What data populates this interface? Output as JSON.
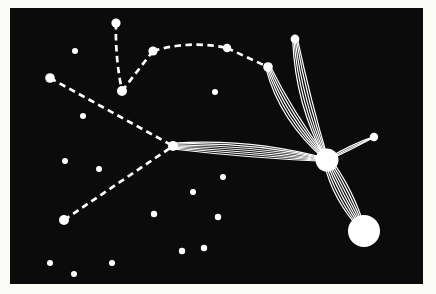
{
  "scene": {
    "description": "Constellation star chart: white stars on a black plate inside a white photo border; dashed lines join constellation stars and bundles of fine rays converge from four stars into a small bright nucleus linked to a large bright nucleus at lower right.",
    "colors": {
      "frame": "#fbfbf8",
      "plate": "#0b0b0b",
      "star": "#ffffff",
      "line": "#ffffff"
    },
    "plate_rect": {
      "x": 10,
      "y": 8,
      "width": 413,
      "height": 276
    },
    "line_style": {
      "dash_width": 2.7,
      "dash_array": "6.5 4.5",
      "strand_width": 1.2
    }
  },
  "stars": [
    {
      "id": "star-top",
      "x": 116,
      "y": 23,
      "r": 4.6
    },
    {
      "id": "star-fork",
      "x": 122,
      "y": 91,
      "r": 5.0
    },
    {
      "id": "star-arc-1",
      "x": 153,
      "y": 51,
      "r": 4.6
    },
    {
      "id": "star-arc-2",
      "x": 227,
      "y": 48,
      "r": 4.2
    },
    {
      "id": "star-arc-3",
      "x": 268,
      "y": 67,
      "r": 4.8
    },
    {
      "id": "star-ray-top",
      "x": 295,
      "y": 39,
      "r": 4.4
    },
    {
      "id": "star-spur",
      "x": 374,
      "y": 137,
      "r": 4.2
    },
    {
      "id": "star-hub",
      "x": 173,
      "y": 146,
      "r": 5.0
    },
    {
      "id": "star-west",
      "x": 50,
      "y": 78,
      "r": 4.8
    },
    {
      "id": "star-southwest",
      "x": 64,
      "y": 220,
      "r": 5.0
    },
    {
      "id": "field-star",
      "x": 75,
      "y": 51,
      "r": 3.0
    },
    {
      "id": "field-star",
      "x": 83,
      "y": 116,
      "r": 3.0
    },
    {
      "id": "field-star",
      "x": 215,
      "y": 92,
      "r": 3.0
    },
    {
      "id": "field-star",
      "x": 65,
      "y": 161,
      "r": 3.0
    },
    {
      "id": "field-star",
      "x": 99,
      "y": 169,
      "r": 3.0
    },
    {
      "id": "field-star",
      "x": 223,
      "y": 177,
      "r": 3.0
    },
    {
      "id": "field-star",
      "x": 193,
      "y": 192,
      "r": 3.0
    },
    {
      "id": "field-star",
      "x": 154,
      "y": 214,
      "r": 3.2
    },
    {
      "id": "field-star",
      "x": 218,
      "y": 217,
      "r": 3.2
    },
    {
      "id": "field-star",
      "x": 182,
      "y": 251,
      "r": 3.2
    },
    {
      "id": "field-star",
      "x": 204,
      "y": 248,
      "r": 3.2
    },
    {
      "id": "field-star",
      "x": 50,
      "y": 263,
      "r": 3.0
    },
    {
      "id": "field-star",
      "x": 74,
      "y": 274,
      "r": 3.0
    },
    {
      "id": "field-star",
      "x": 112,
      "y": 263,
      "r": 3.0
    }
  ],
  "nuclei": [
    {
      "id": "nucleus-inner",
      "x": 327,
      "y": 160,
      "r": 11.5
    },
    {
      "id": "nucleus-outer",
      "x": 364,
      "y": 231,
      "r": 16.0
    }
  ],
  "dashed_links": [
    {
      "from": [
        116,
        23
      ],
      "to": [
        122,
        91
      ],
      "ctrl": [
        115,
        57
      ]
    },
    {
      "from": [
        122,
        91
      ],
      "to": [
        153,
        51
      ]
    },
    {
      "from": [
        153,
        51
      ],
      "to": [
        227,
        48
      ],
      "ctrl": [
        190,
        40
      ]
    },
    {
      "from": [
        227,
        48
      ],
      "to": [
        268,
        67
      ]
    },
    {
      "from": [
        50,
        78
      ],
      "to": [
        173,
        146
      ]
    },
    {
      "from": [
        64,
        220
      ],
      "to": [
        173,
        146
      ]
    }
  ],
  "ray_bundles": [
    {
      "from": [
        173,
        146
      ],
      "to": [
        327,
        160
      ],
      "ctrl": [
        250,
        148
      ],
      "strands": 7,
      "spread": 10
    },
    {
      "from": [
        268,
        67
      ],
      "to": [
        327,
        160
      ],
      "ctrl": [
        286,
        116
      ],
      "strands": 5,
      "spread": 8
    },
    {
      "from": [
        295,
        39
      ],
      "to": [
        327,
        160
      ],
      "ctrl": [
        303,
        103
      ],
      "strands": 5,
      "spread": 8
    },
    {
      "from": [
        327,
        160
      ],
      "to": [
        364,
        231
      ],
      "ctrl": [
        343,
        195
      ],
      "strands": 7,
      "spread": 12
    },
    {
      "from": [
        327,
        160
      ],
      "to": [
        374,
        137
      ],
      "ctrl": [
        351,
        147
      ],
      "strands": 3,
      "spread": 2.5
    }
  ]
}
